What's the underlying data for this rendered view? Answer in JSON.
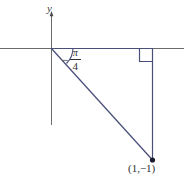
{
  "figure": {
    "type": "coordinate-plane-diagram",
    "background_color": "#ffffff",
    "width": 184,
    "height": 180,
    "axis_color": "#6b6b6b",
    "shape_color": "#4a4f7a",
    "text_color": "#2f2f2f"
  },
  "axes": {
    "y_axis_label": "y",
    "origin": {
      "x": 51,
      "y": 48
    },
    "y_axis": {
      "x": 51,
      "top": 12,
      "bottom": 125
    },
    "x_axis": {
      "y": 48,
      "left": 0,
      "right": 184
    }
  },
  "angle": {
    "sign": "−",
    "numerator": "π",
    "denominator": "4",
    "full_label": "−π/4",
    "value_radians": -0.7853981633974483,
    "value_degrees": -45
  },
  "point": {
    "label": "(1,−1)",
    "x_value": 1,
    "y_value": -1,
    "pixel": {
      "x": 152,
      "y": 160
    }
  },
  "triangle": {
    "vertices": [
      {
        "x": 51,
        "y": 48
      },
      {
        "x": 152,
        "y": 48
      },
      {
        "x": 152,
        "y": 160
      }
    ],
    "right_angle_at": {
      "x": 152,
      "y": 48
    },
    "right_angle_marker_size": 13
  },
  "icons": {
    "y_axis_arrow": "arrow-up-icon",
    "point_marker": "filled-dot-icon",
    "right_angle": "right-angle-marker-icon",
    "angle_arc": "angle-arc-icon"
  }
}
